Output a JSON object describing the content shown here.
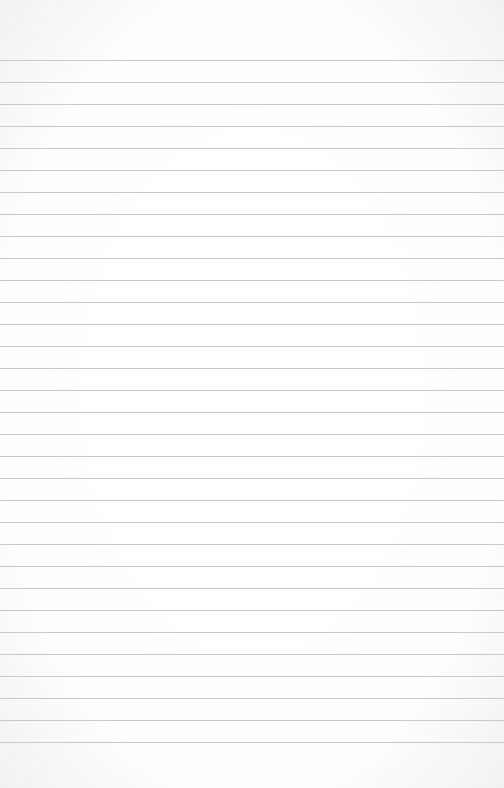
{
  "paper": {
    "type": "ruled-notebook-paper",
    "background_color": "#ffffff",
    "line_color": "#c9c9c9",
    "first_line_y": 60,
    "line_spacing": 22,
    "line_count": 32
  }
}
